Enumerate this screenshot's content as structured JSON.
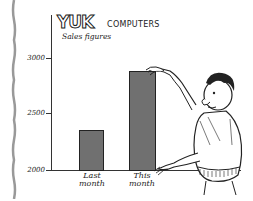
{
  "chart_data": {
    "type": "bar",
    "title_parts": {
      "brand": "YUK",
      "suffix": "COMPUTERS"
    },
    "subtitle": "Sales figures",
    "xlabel": "",
    "ylabel": "",
    "categories": [
      "Last month",
      "This month"
    ],
    "category_lines": [
      [
        "Last",
        "month"
      ],
      [
        "This",
        "month"
      ]
    ],
    "values": [
      2360,
      2880
    ],
    "ylim": [
      2000,
      3100
    ],
    "yticks": [
      2000,
      2500,
      3000
    ],
    "ytick_labels": [
      "2000",
      "2500",
      "3000"
    ],
    "grid": false,
    "legend": null,
    "bar_color": "#707070",
    "annotations": [
      "Cartoon man stretching the 'This month' bar upward by hand"
    ]
  }
}
